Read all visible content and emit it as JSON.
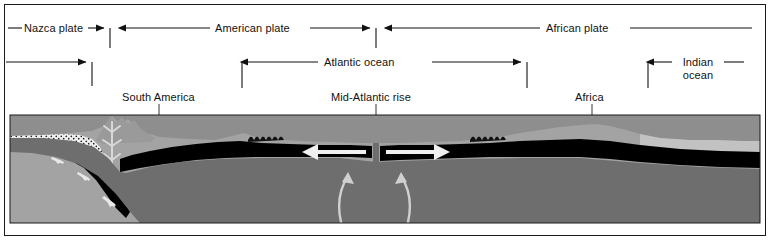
{
  "figure": {
    "width": 774,
    "height": 242
  },
  "colors": {
    "ink": "#111111",
    "frame": "#1a1a1a",
    "background": "#ffffff",
    "water": "#8e8e8e",
    "crust_light": "#a8a8a8",
    "mantle": "#6e6e6e",
    "lithosphere": "#000000",
    "arrow_light": "#e8e8e8",
    "sediment": "#b9b9b9"
  },
  "plate_labels": [
    {
      "id": "nazca",
      "text": "Nazca plate"
    },
    {
      "id": "american",
      "text": "American plate"
    },
    {
      "id": "african",
      "text": "African plate"
    }
  ],
  "ocean_labels": [
    {
      "id": "atlantic",
      "text": "Atlantic ocean"
    },
    {
      "id": "indian",
      "line1": "Indian",
      "line2": "ocean"
    }
  ],
  "feature_labels": [
    {
      "id": "south-america",
      "text": "South America"
    },
    {
      "id": "mid-atlantic-rise",
      "text": "Mid-Atlantic rise"
    },
    {
      "id": "africa",
      "text": "Africa"
    }
  ],
  "plate_boundaries": [
    {
      "id": "nazca-american",
      "x": 110
    },
    {
      "id": "american-african",
      "x": 376
    }
  ],
  "extent_brackets": [
    {
      "id": "nazca-extent",
      "from": 6,
      "to": 92
    },
    {
      "id": "atlantic-extent",
      "from": 242,
      "to": 527
    },
    {
      "id": "indian-extent",
      "from": 648,
      "to": 762
    }
  ],
  "motion_arrows": [
    {
      "id": "subduction-arrow-1",
      "direction": "down-right"
    },
    {
      "id": "subduction-arrow-2",
      "direction": "down-right"
    },
    {
      "id": "subduction-arrow-3",
      "direction": "down-right"
    },
    {
      "id": "spreading-arrow-west",
      "direction": "left"
    },
    {
      "id": "spreading-arrow-east",
      "direction": "right"
    },
    {
      "id": "convection-upwell-west",
      "direction": "up"
    },
    {
      "id": "convection-upwell-east",
      "direction": "up"
    }
  ]
}
